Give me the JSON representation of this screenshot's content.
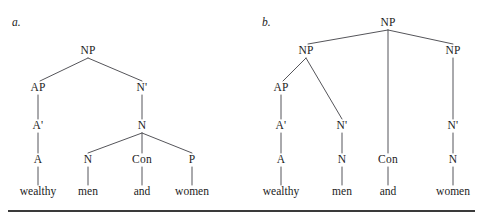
{
  "figure": {
    "rule_color": "#3a3a3a",
    "line_color": "#55555a",
    "text_color": "#1c1c1c"
  },
  "panels": [
    {
      "letter": "a.",
      "letter_x": 12,
      "letter_y": 23,
      "nodes": [
        {
          "label": "NP",
          "x": 88,
          "y": 51
        },
        {
          "label": "AP",
          "x": 38,
          "y": 88
        },
        {
          "label": "N'",
          "x": 142,
          "y": 88
        },
        {
          "label": "A'",
          "x": 38,
          "y": 126
        },
        {
          "label": "N",
          "x": 142,
          "y": 126
        },
        {
          "label": "A",
          "x": 38,
          "y": 160
        },
        {
          "label": "N",
          "x": 88,
          "y": 160
        },
        {
          "label": "Con",
          "x": 142,
          "y": 160
        },
        {
          "label": "P",
          "x": 192,
          "y": 160
        }
      ],
      "leaves": [
        {
          "label": "wealthy",
          "x": 38,
          "y": 192
        },
        {
          "label": "men",
          "x": 88,
          "y": 192
        },
        {
          "label": "and",
          "x": 142,
          "y": 192
        },
        {
          "label": "women",
          "x": 192,
          "y": 192
        }
      ],
      "edges": [
        {
          "x1": 88,
          "y1": 58,
          "x2": 40,
          "y2": 81
        },
        {
          "x1": 88,
          "y1": 58,
          "x2": 142,
          "y2": 81
        },
        {
          "x1": 38,
          "y1": 95,
          "x2": 38,
          "y2": 119
        },
        {
          "x1": 142,
          "y1": 95,
          "x2": 142,
          "y2": 119
        },
        {
          "x1": 38,
          "y1": 133,
          "x2": 38,
          "y2": 153
        },
        {
          "x1": 142,
          "y1": 133,
          "x2": 88,
          "y2": 153
        },
        {
          "x1": 142,
          "y1": 133,
          "x2": 142,
          "y2": 153
        },
        {
          "x1": 142,
          "y1": 133,
          "x2": 192,
          "y2": 153
        },
        {
          "x1": 38,
          "y1": 167,
          "x2": 38,
          "y2": 185
        },
        {
          "x1": 88,
          "y1": 167,
          "x2": 88,
          "y2": 185
        },
        {
          "x1": 142,
          "y1": 167,
          "x2": 142,
          "y2": 185
        },
        {
          "x1": 192,
          "y1": 167,
          "x2": 192,
          "y2": 185
        }
      ]
    },
    {
      "letter": "b.",
      "letter_x": 262,
      "letter_y": 23,
      "nodes": [
        {
          "label": "NP",
          "x": 388,
          "y": 23
        },
        {
          "label": "NP",
          "x": 306,
          "y": 51
        },
        {
          "label": "NP",
          "x": 453,
          "y": 51
        },
        {
          "label": "AP",
          "x": 281,
          "y": 88
        },
        {
          "label": "A'",
          "x": 281,
          "y": 126
        },
        {
          "label": "N'",
          "x": 342,
          "y": 126
        },
        {
          "label": "N'",
          "x": 453,
          "y": 126
        },
        {
          "label": "A",
          "x": 281,
          "y": 160
        },
        {
          "label": "N",
          "x": 342,
          "y": 160
        },
        {
          "label": "Con",
          "x": 388,
          "y": 160
        },
        {
          "label": "N",
          "x": 453,
          "y": 160
        }
      ],
      "leaves": [
        {
          "label": "wealthy",
          "x": 281,
          "y": 192
        },
        {
          "label": "men",
          "x": 342,
          "y": 192
        },
        {
          "label": "and",
          "x": 388,
          "y": 192
        },
        {
          "label": "women",
          "x": 453,
          "y": 192
        }
      ],
      "edges": [
        {
          "x1": 388,
          "y1": 30,
          "x2": 308,
          "y2": 44
        },
        {
          "x1": 388,
          "y1": 30,
          "x2": 388,
          "y2": 153
        },
        {
          "x1": 388,
          "y1": 30,
          "x2": 453,
          "y2": 44
        },
        {
          "x1": 306,
          "y1": 58,
          "x2": 283,
          "y2": 81
        },
        {
          "x1": 306,
          "y1": 58,
          "x2": 342,
          "y2": 119
        },
        {
          "x1": 453,
          "y1": 58,
          "x2": 453,
          "y2": 119
        },
        {
          "x1": 281,
          "y1": 95,
          "x2": 281,
          "y2": 119
        },
        {
          "x1": 281,
          "y1": 133,
          "x2": 281,
          "y2": 153
        },
        {
          "x1": 342,
          "y1": 133,
          "x2": 342,
          "y2": 153
        },
        {
          "x1": 453,
          "y1": 133,
          "x2": 453,
          "y2": 153
        },
        {
          "x1": 281,
          "y1": 167,
          "x2": 281,
          "y2": 185
        },
        {
          "x1": 342,
          "y1": 167,
          "x2": 342,
          "y2": 185
        },
        {
          "x1": 388,
          "y1": 167,
          "x2": 388,
          "y2": 185
        },
        {
          "x1": 453,
          "y1": 167,
          "x2": 453,
          "y2": 185
        }
      ]
    }
  ]
}
